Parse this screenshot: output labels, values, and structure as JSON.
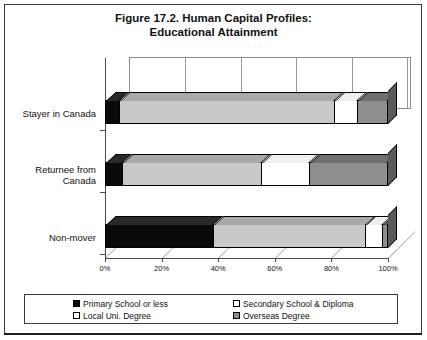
{
  "figure": {
    "title_line1": "Figure 17.2. Human Capital Profiles:",
    "title_line2": "Educational Attainment"
  },
  "legend": {
    "items": [
      {
        "label": "Primary School or less",
        "swatch": "black",
        "color": "#0a0a0a"
      },
      {
        "label": "Secondary School & Diploma",
        "swatch": "white",
        "color": "#ffffff"
      },
      {
        "label": "Local Uni. Degree",
        "swatch": "white",
        "color": "#ffffff"
      },
      {
        "label": "Overseas Degree",
        "swatch": "gray",
        "color": "#8e8e8e"
      }
    ]
  },
  "chart_data": {
    "type": "bar",
    "orientation": "horizontal",
    "stacked": true,
    "title": "Figure 17.2. Human Capital Profiles: Educational Attainment",
    "xlabel": "",
    "ylabel": "",
    "xlim": [
      0,
      100
    ],
    "xticks": [
      "0%",
      "20%",
      "40%",
      "60%",
      "80%",
      "100%"
    ],
    "xtick_values": [
      0,
      20,
      40,
      60,
      80,
      100
    ],
    "grid": true,
    "legend_position": "bottom",
    "categories": [
      "Stayer in Canada",
      "Returnee from Canada",
      "Non-mover"
    ],
    "series": [
      {
        "name": "Primary School or less",
        "color": "#0a0a0a",
        "values": [
          5,
          6,
          38
        ]
      },
      {
        "name": "Secondary School & Diploma",
        "color": "#c9c9c9",
        "values": [
          76,
          49,
          54
        ]
      },
      {
        "name": "Local Uni. Degree",
        "color": "#ffffff",
        "values": [
          8,
          17,
          6
        ]
      },
      {
        "name": "Overseas Degree",
        "color": "#8e8e8e",
        "values": [
          11,
          28,
          2
        ]
      }
    ]
  }
}
